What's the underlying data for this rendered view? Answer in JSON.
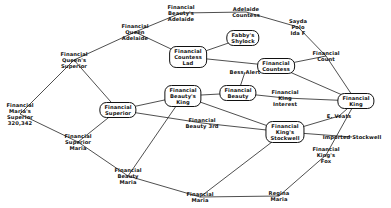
{
  "nodes": [
    {
      "id": "marias_superior",
      "label": "Financial\nMaria's\nSuperior\n320,342",
      "x": 20,
      "y": 114,
      "boxed": false
    },
    {
      "id": "queens_superior",
      "label": "Financial\nQueen's\nSuperior",
      "x": 74,
      "y": 60,
      "boxed": false
    },
    {
      "id": "superior_maria",
      "label": "Financial\nSuperior\nMaria",
      "x": 78,
      "y": 142,
      "boxed": false
    },
    {
      "id": "queen_adelaide",
      "label": "Financial\nQueen\nAdelaide",
      "x": 135,
      "y": 32,
      "boxed": false
    },
    {
      "id": "superior",
      "label": "Financial\nSuperior",
      "x": 118,
      "y": 110,
      "boxed": true
    },
    {
      "id": "beauty_maria",
      "label": "Financial\nBeauty\nMaria",
      "x": 128,
      "y": 176,
      "boxed": false
    },
    {
      "id": "beautys_adelaide",
      "label": "Financial\nBeauty's\nAdelaide",
      "x": 181,
      "y": 13,
      "boxed": false
    },
    {
      "id": "countess_lad",
      "label": "Financial\nCountess\nLad",
      "x": 188,
      "y": 57,
      "boxed": true
    },
    {
      "id": "beautys_king",
      "label": "Financial\nBeauty's\nKing",
      "x": 183,
      "y": 96,
      "boxed": true
    },
    {
      "id": "beauty_3rd",
      "label": "Financial\nBeauty 3rd",
      "x": 202,
      "y": 123,
      "boxed": false
    },
    {
      "id": "maria",
      "label": "Financial\nMaria",
      "x": 200,
      "y": 197,
      "boxed": false
    },
    {
      "id": "adelaide_countess",
      "label": "Adelaide\nCountess",
      "x": 246,
      "y": 12,
      "boxed": false
    },
    {
      "id": "fabbys_shylock",
      "label": "Fabby's\nShylock",
      "x": 243,
      "y": 38,
      "boxed": true
    },
    {
      "id": "financial_countess",
      "label": "Financial\nCountess",
      "x": 276,
      "y": 66,
      "boxed": true
    },
    {
      "id": "bess_alert",
      "label": "Bess Alert",
      "x": 245,
      "y": 72,
      "boxed": false
    },
    {
      "id": "financial_beauty",
      "label": "Financial\nBeauty",
      "x": 238,
      "y": 93,
      "boxed": true
    },
    {
      "id": "king_interest",
      "label": "Financial\nKing\nInterest",
      "x": 285,
      "y": 98,
      "boxed": false
    },
    {
      "id": "kings_stockwell",
      "label": "Financial\nKing's\nStockwell",
      "x": 285,
      "y": 132,
      "boxed": true
    },
    {
      "id": "regina_maria",
      "label": "Regina\nMaria",
      "x": 279,
      "y": 196,
      "boxed": false
    },
    {
      "id": "sayda_polo",
      "label": "Sayda\nPolo\nIda F",
      "x": 298,
      "y": 27,
      "boxed": false
    },
    {
      "id": "financial_count",
      "label": "Financial\nCount",
      "x": 326,
      "y": 56,
      "boxed": false
    },
    {
      "id": "financial_king",
      "label": "Financial\nKing",
      "x": 356,
      "y": 101,
      "boxed": true
    },
    {
      "id": "e_veats",
      "label": "E. Veats",
      "x": 339,
      "y": 116,
      "boxed": false
    },
    {
      "id": "imported_stockwell",
      "label": "Imported Stockwell",
      "x": 352,
      "y": 137,
      "boxed": false
    },
    {
      "id": "kings_fox",
      "label": "Financial\nKing's\nFox",
      "x": 326,
      "y": 155,
      "boxed": false
    }
  ],
  "edges": [
    [
      "marias_superior",
      "queens_superior"
    ],
    [
      "marias_superior",
      "superior_maria"
    ],
    [
      "queens_superior",
      "queen_adelaide"
    ],
    [
      "queens_superior",
      "superior"
    ],
    [
      "superior_maria",
      "superior"
    ],
    [
      "superior_maria",
      "beauty_maria"
    ],
    [
      "queen_adelaide",
      "beautys_adelaide"
    ],
    [
      "queen_adelaide",
      "countess_lad"
    ],
    [
      "superior",
      "beautys_king"
    ],
    [
      "superior",
      "beauty_3rd"
    ],
    [
      "beauty_maria",
      "beautys_king"
    ],
    [
      "beauty_maria",
      "maria"
    ],
    [
      "beautys_adelaide",
      "adelaide_countess"
    ],
    [
      "countess_lad",
      "fabbys_shylock"
    ],
    [
      "countess_lad",
      "financial_countess"
    ],
    [
      "beautys_king",
      "financial_beauty"
    ],
    [
      "beautys_king",
      "kings_stockwell"
    ],
    [
      "financial_beauty",
      "king_interest"
    ],
    [
      "financial_beauty",
      "bess_alert"
    ],
    [
      "beauty_3rd",
      "kings_stockwell"
    ],
    [
      "maria",
      "kings_stockwell"
    ],
    [
      "maria",
      "regina_maria"
    ],
    [
      "adelaide_countess",
      "sayda_polo"
    ],
    [
      "financial_countess",
      "financial_count"
    ],
    [
      "financial_countess",
      "financial_king"
    ],
    [
      "sayda_polo",
      "financial_count"
    ],
    [
      "king_interest",
      "financial_king"
    ],
    [
      "financial_count",
      "financial_king"
    ],
    [
      "financial_king",
      "e_veats"
    ],
    [
      "financial_king",
      "kings_fox"
    ],
    [
      "kings_stockwell",
      "e_veats"
    ],
    [
      "kings_stockwell",
      "imported_stockwell"
    ],
    [
      "regina_maria",
      "kings_fox"
    ]
  ]
}
